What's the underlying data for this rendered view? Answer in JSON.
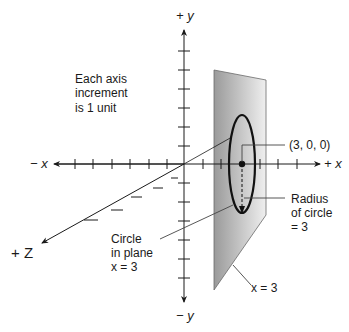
{
  "diagram": {
    "axes": {
      "plus_y": "+ y",
      "minus_y": "− y",
      "plus_x": "+ x",
      "minus_x": "− x",
      "plus_z": "+ Z"
    },
    "note": {
      "line1": "Each axis",
      "line2": "increment",
      "line3": "is 1 unit"
    },
    "point_label": "(3, 0, 0)",
    "radius_label": {
      "line1": "Radius",
      "line2": "of circle",
      "line3": "= 3"
    },
    "circle_label": {
      "line1": "Circle",
      "line2": "in plane",
      "line3": "x = 3"
    },
    "plane_label": "x = 3",
    "colors": {
      "plane_dark": "#9a9a9a",
      "plane_light": "#eeeeee",
      "ink": "#1a1a1a"
    }
  }
}
